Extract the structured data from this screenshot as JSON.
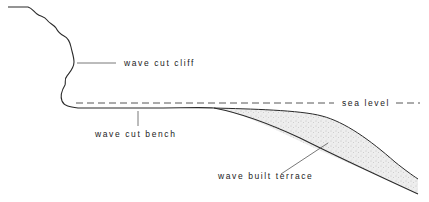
{
  "diagram": {
    "type": "coastal-cross-section",
    "colors": {
      "line": "#2a2a2a",
      "text": "#222222",
      "terrace_fill": "#e6e6e6",
      "background": "#ffffff"
    },
    "labels": {
      "cliff": "wave cut cliff",
      "bench": "wave cut bench",
      "sea_level": "sea level",
      "terrace": "wave built terrace"
    }
  }
}
